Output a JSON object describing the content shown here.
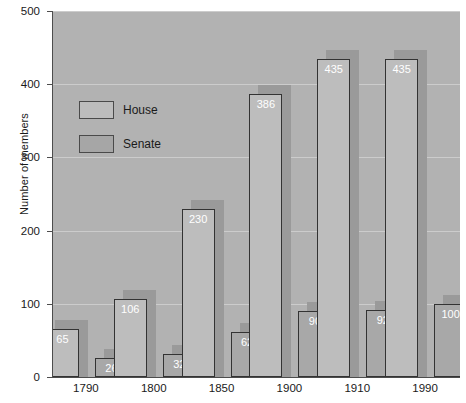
{
  "chart_data": {
    "type": "bar",
    "title": "",
    "xlabel": "",
    "ylabel": "Number of members",
    "categories": [
      "1790",
      "1800",
      "1850",
      "1900",
      "1910",
      "1990"
    ],
    "series": [
      {
        "name": "House",
        "values": [
          65,
          106,
          230,
          386,
          435,
          435
        ]
      },
      {
        "name": "Senate",
        "values": [
          26,
          32,
          62,
          90,
          92,
          100
        ]
      }
    ],
    "ylim": [
      0,
      500
    ],
    "yticks": [
      0,
      100,
      200,
      300,
      400,
      500
    ],
    "ytick_labels": [
      "0",
      "100",
      "200",
      "300",
      "400",
      "500"
    ],
    "grid": true,
    "legend_position": "upper-left-inside",
    "value_labels": true
  },
  "legend": {
    "items": [
      {
        "label": "House",
        "color": "#bdbdbd"
      },
      {
        "label": "Senate",
        "color": "#a6a6a6"
      }
    ]
  },
  "style": {
    "plot_background": "#b2b2b2",
    "figure_background": "#ffffff",
    "house_color": "#bdbdbd",
    "senate_color": "#a8a8a8",
    "shadow_color": "#9a9a9a",
    "axis_color": "#4d4d4d",
    "value_label_color": "#ffffff"
  },
  "caption": {
    "text": ""
  }
}
